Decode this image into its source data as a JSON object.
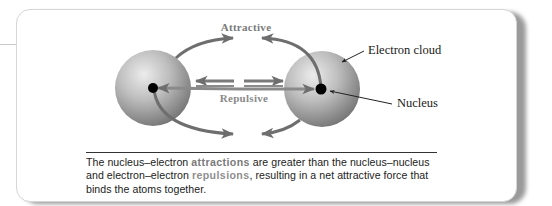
{
  "figure": {
    "labels": {
      "attractive": "Attractive",
      "repulsive": "Repulsive",
      "electron_cloud": "Electron cloud",
      "nucleus": "Nucleus"
    },
    "caption": {
      "part1": "The nucleus–electron ",
      "highlight_attractions": "attractions",
      "part2": " are greater than the nucleus–nucleus and electron–electron ",
      "highlight_repulsions": "repulsions",
      "part3": ", resulting in a net attractive force that binds the atoms together."
    },
    "colors": {
      "arrow": "#6e6e6e",
      "sphere_light": "#e4e4e4",
      "sphere_dark": "#7d7d7d",
      "nucleus": "#000000",
      "label_gray": "#7a7a7a"
    }
  }
}
